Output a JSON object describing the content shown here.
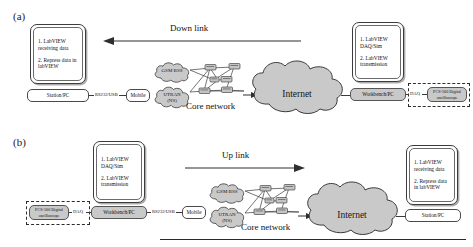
{
  "figure": {
    "panels": [
      {
        "tag": "(a)",
        "link": {
          "label": "Down link",
          "direction": "left"
        },
        "note_left": {
          "line1": "1. LabVIEW receiving data",
          "line2": "2. Repress data in labVIEW"
        },
        "note_right": {
          "line1": "1. LabVIEW DAQ/Sim",
          "line2": "2. LabVIEW transmission"
        },
        "left_node": "Station/PC",
        "left_conn": "RS232/USB",
        "mobile": "Mobile",
        "right_node": "Workbench/PC",
        "right_conn": "DAQ",
        "instrument": "PCS-500 Digital oscilloscope",
        "cloud_gsm": "GSM BSS",
        "cloud_utran_l1": "UTRAN",
        "cloud_utran_l2": "(NS)",
        "core_label": "Core network",
        "internet": "Internet"
      },
      {
        "tag": "(b)",
        "link": {
          "label": "Up link",
          "direction": "right"
        },
        "note_left": {
          "line1": "1. LabVIEW DAQ/Sim",
          "line2": "2. LabVIEW transmission"
        },
        "note_right": {
          "line1": "1. LabVIEW receiving data",
          "line2": "2. Repress data in labVIEW"
        },
        "left_node": "Workbench/PC",
        "left_conn": "RS232/USB",
        "mobile": "Mobile",
        "right_node": "Station/PC",
        "right_conn": "DAQ",
        "instrument": "PCS-500 Digital oscilloscope",
        "cloud_gsm": "GSM BSS",
        "cloud_utran_l1": "UTRAN",
        "cloud_utran_l2": "(NS)",
        "core_label": "Core network",
        "internet": "Internet"
      }
    ],
    "colors": {
      "cloud_fill": "#c9c9c9",
      "cloud_stroke": "#3a3a3a",
      "node_fill": "#c9c9c9",
      "line": "#3a3a3a"
    }
  }
}
